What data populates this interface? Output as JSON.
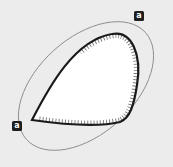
{
  "diagram": {
    "background_color": "#ececec",
    "ellipse": {
      "cx": 86,
      "cy": 86,
      "rx": 80,
      "ry": 48,
      "rotation": -42,
      "stroke": "#8a8a8a",
      "stroke_width": 0.9
    },
    "teardrop": {
      "fill": "#ffffff",
      "stroke": "#1a1a1a",
      "stroke_width": 2.2,
      "hatch_color": "#777777"
    },
    "labels": [
      {
        "id": "upper-right",
        "text": "a",
        "x": 134,
        "y": 11
      },
      {
        "id": "lower-left",
        "text": "a",
        "x": 12,
        "y": 121
      }
    ]
  }
}
